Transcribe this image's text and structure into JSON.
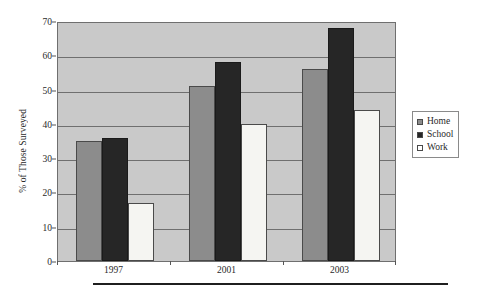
{
  "chart_data": {
    "type": "bar",
    "title": "",
    "subtitle": "",
    "xlabel": "",
    "ylabel": "% of Those Surveyed",
    "categories": [
      "1997",
      "2001",
      "2003"
    ],
    "series": [
      {
        "name": "Home",
        "color": "#8c8c8c",
        "values": [
          35,
          51,
          56
        ]
      },
      {
        "name": "School",
        "color": "#262626",
        "values": [
          36,
          58,
          68
        ]
      },
      {
        "name": "Work",
        "color": "#ffffff",
        "values": [
          17,
          40,
          44
        ]
      }
    ],
    "ylim": [
      0,
      70
    ],
    "yticks": [
      0,
      10,
      20,
      30,
      40,
      50,
      60,
      70
    ],
    "ytick_labels": [
      "0",
      "10",
      "20",
      "30",
      "40",
      "50",
      "60",
      "70"
    ],
    "grid": true,
    "grid_axis": "y",
    "legend_position": "right",
    "plot_background": "#c9c9c9",
    "axis_color": "#6f6f6f"
  },
  "legend": {
    "items": [
      {
        "label": "Home",
        "swatch": "home"
      },
      {
        "label": "School",
        "swatch": "school"
      },
      {
        "label": "Work",
        "swatch": "work"
      }
    ]
  }
}
